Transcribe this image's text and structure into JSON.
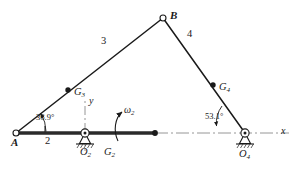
{
  "figure": {
    "type": "fourbar-linkage-kinematic-diagram",
    "background": "#ffffff",
    "ink": "#1a1a1a"
  },
  "joints": [
    {
      "name": "A",
      "label": "A",
      "x": 16,
      "y": 133,
      "style": "open-circle"
    },
    {
      "name": "O2",
      "label": "O",
      "sub": "2",
      "x": 85,
      "y": 133,
      "style": "grounded-pivot"
    },
    {
      "name": "B",
      "label": "B",
      "x": 163,
      "y": 18,
      "style": "open-circle"
    },
    {
      "name": "O4",
      "label": "O",
      "sub": "4",
      "x": 245,
      "y": 133,
      "style": "grounded-pivot"
    }
  ],
  "centers_of_mass": [
    {
      "name": "G2",
      "label": "G",
      "sub": "2",
      "x": 104,
      "y": 133,
      "style": "filled-dot-on-link"
    },
    {
      "name": "G3",
      "label": "G",
      "sub": "3",
      "x": 68,
      "y": 90,
      "style": "filled-dot"
    },
    {
      "name": "G4",
      "label": "G",
      "sub": "4",
      "x": 213,
      "y": 85,
      "style": "filled-dot"
    }
  ],
  "links": [
    {
      "name": "link-2",
      "label": "2",
      "from": "A",
      "to": "O2",
      "weight": "thick"
    },
    {
      "name": "link-3",
      "label": "3",
      "from": "A",
      "to": "B",
      "weight": "medium"
    },
    {
      "name": "link-4",
      "label": "4",
      "from": "B",
      "to": "O4",
      "weight": "medium"
    }
  ],
  "link_label_positions": {
    "two": {
      "x": 45,
      "y": 141
    },
    "three": {
      "x": 101,
      "y": 41
    },
    "four": {
      "x": 187,
      "y": 34
    }
  },
  "angles": [
    {
      "name": "theta2",
      "value": "36.9°",
      "x": 36,
      "y": 119,
      "at": "A"
    },
    {
      "name": "theta4",
      "value": "53.1°",
      "x": 208,
      "y": 118,
      "at": "O4"
    }
  ],
  "axes": {
    "x": {
      "label": "x",
      "x": 281,
      "y": 131,
      "style": "dash-dot",
      "from_x": 155,
      "to_x": 289,
      "y_pos": 133
    },
    "y": {
      "label": "y",
      "x": 88,
      "y": 101,
      "style": "dash-dot",
      "from_y": 100,
      "to_y": 133,
      "x_pos": 85
    }
  },
  "angular_velocity": {
    "name": "omega2",
    "label": "ω",
    "sub": "2",
    "x": 124,
    "y": 110,
    "direction": "counterclockwise"
  },
  "colors": {
    "ink": "#1a1a1a",
    "link_fill": "#2b2b2b",
    "centerline": "#8a8a8a",
    "hatch": "#3a3a3a"
  }
}
